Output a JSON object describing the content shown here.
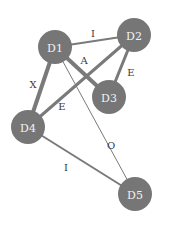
{
  "diagram": {
    "type": "undirected-weighted-graph",
    "node_color": "#767676",
    "node_text_color": "#f2f2f2",
    "edge_color": "#7a7a7a",
    "nodes": [
      {
        "id": "D1",
        "label": "D1",
        "x": 55,
        "y": 47,
        "r": 17
      },
      {
        "id": "D2",
        "label": "D2",
        "x": 134,
        "y": 35,
        "r": 17
      },
      {
        "id": "D3",
        "label": "D3",
        "x": 109,
        "y": 97,
        "r": 17
      },
      {
        "id": "D4",
        "label": "D4",
        "x": 28,
        "y": 127,
        "r": 17
      },
      {
        "id": "D5",
        "label": "D5",
        "x": 135,
        "y": 194,
        "r": 17
      }
    ],
    "edges": [
      {
        "from": "D1",
        "to": "D2",
        "label": "I",
        "width": 2,
        "lx": 93,
        "ly": 33
      },
      {
        "from": "D1",
        "to": "D3",
        "label": "A",
        "width": 4,
        "lx": 84,
        "ly": 60
      },
      {
        "from": "D1",
        "to": "D4",
        "label": "X",
        "width": 4,
        "lx": 33,
        "ly": 84
      },
      {
        "from": "D1",
        "to": "D5",
        "label": "O",
        "width": 1,
        "lx": 111,
        "ly": 145
      },
      {
        "from": "D2",
        "to": "D3",
        "label": "E",
        "width": 3,
        "lx": 131,
        "ly": 72
      },
      {
        "from": "D2",
        "to": "D4",
        "label": "E",
        "width": 3,
        "lx": 62,
        "ly": 106
      },
      {
        "from": "D4",
        "to": "D5",
        "label": "I",
        "width": 2,
        "lx": 66,
        "ly": 167
      }
    ]
  }
}
